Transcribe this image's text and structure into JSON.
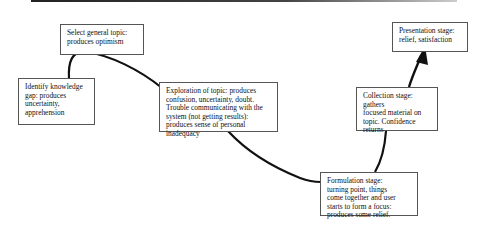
{
  "diagram": {
    "type": "process-flow",
    "title": "",
    "stages": [
      {
        "id": "identify",
        "lines": [
          "Identify knowledge",
          "gap: produces",
          "uncertainty,",
          "apprehension"
        ]
      },
      {
        "id": "select",
        "lines": [
          "Select general topic:",
          "produces optimism"
        ]
      },
      {
        "id": "exploration",
        "lines": [
          "Exploration of topic: produces",
          "confusion, uncertainty, doubt.",
          "Trouble communicating with the",
          "system (not getting results):",
          "produces sense of personal",
          "inadequacy"
        ]
      },
      {
        "id": "formulation",
        "lines": [
          "Formulation stage:",
          "turning point, things",
          "come together and user",
          "starts to form a focus:",
          "produces some relief."
        ]
      },
      {
        "id": "collection",
        "lines": [
          "Collection stage: gathers",
          "focused material on",
          "topic. Confidence returns"
        ]
      },
      {
        "id": "presentation",
        "lines": [
          "Presentation stage:",
          "relief, satisfaction"
        ]
      }
    ],
    "connector": {
      "style": "curved-line",
      "ends_with": "arrow-icon",
      "color": "#111111"
    }
  }
}
